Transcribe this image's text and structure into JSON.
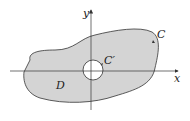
{
  "diagram": {
    "labels": {
      "x_axis": "x",
      "y_axis": "y",
      "outer_curve": "C",
      "inner_curve": "C′",
      "region": "D"
    },
    "colors": {
      "region_fill": "#d4d4d4",
      "hole_fill": "#ffffff",
      "stroke": "#333333",
      "background": "#ffffff"
    }
  }
}
